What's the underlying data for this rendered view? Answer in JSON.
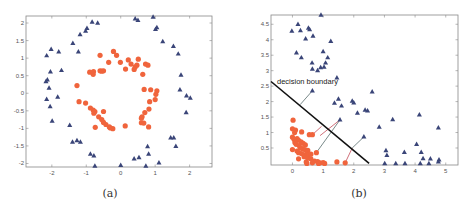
{
  "colors": {
    "class_circle": "#f0643c",
    "class_triangle": "#3a4578",
    "boundary": "#111111",
    "projection_gray": "#7a8a8a",
    "projection_red": "#d0707a",
    "axis": "#888888"
  },
  "chart_data": [
    {
      "type": "scatter",
      "caption": "(a)",
      "title": "",
      "xlabel": "",
      "ylabel": "",
      "xlim": [
        -2.75,
        2.65
      ],
      "ylim": [
        -2.1,
        2.2
      ],
      "xticks": [
        -2,
        -1,
        0,
        1,
        2
      ],
      "yticks": [
        -2,
        -1.5,
        -1,
        -0.5,
        0,
        0.5,
        1,
        1.5,
        2
      ],
      "xtick_labels": [
        "-2",
        "-1",
        "0",
        "1",
        "2"
      ],
      "ytick_labels": [
        "-2",
        "-1.5",
        "-1",
        "-0.5",
        "0",
        "0.5",
        "1",
        "1.5",
        "2"
      ],
      "grid": false,
      "series": [
        {
          "name": "outer ring",
          "marker": "triangle",
          "points": [
            [
              -0.83,
              2.03
            ],
            [
              -0.67,
              2.0
            ],
            [
              -0.98,
              1.85
            ],
            [
              -1.02,
              1.77
            ],
            [
              -1.18,
              1.67
            ],
            [
              -1.39,
              1.42
            ],
            [
              -1.23,
              1.18
            ],
            [
              -2.02,
              1.25
            ],
            [
              -1.8,
              1.18
            ],
            [
              -2.15,
              1.07
            ],
            [
              -1.72,
              0.65
            ],
            [
              -2.04,
              0.61
            ],
            [
              -2.13,
              0.38
            ],
            [
              -2.17,
              0.33
            ],
            [
              -2.08,
              0.15
            ],
            [
              -2.15,
              -0.17
            ],
            [
              -1.83,
              -0.11
            ],
            [
              -2.05,
              -0.38
            ],
            [
              -1.99,
              -0.79
            ],
            [
              -1.48,
              -0.91
            ],
            [
              -1.4,
              -1.39
            ],
            [
              -1.27,
              -1.35
            ],
            [
              -1.17,
              -1.39
            ],
            [
              -0.88,
              -1.73
            ],
            [
              -0.78,
              -1.78
            ],
            [
              -0.75,
              -2.07
            ],
            [
              0.0,
              -2.05
            ],
            [
              0.39,
              -1.87
            ],
            [
              0.53,
              -1.83
            ],
            [
              0.73,
              -2.07
            ],
            [
              0.78,
              -1.52
            ],
            [
              0.81,
              -1.73
            ],
            [
              1.11,
              -1.98
            ],
            [
              1.45,
              -1.27
            ],
            [
              1.54,
              -1.27
            ],
            [
              1.6,
              -1.51
            ],
            [
              1.9,
              -0.55
            ],
            [
              1.91,
              -0.07
            ],
            [
              2.02,
              -0.14
            ],
            [
              1.72,
              0.1
            ],
            [
              1.75,
              0.52
            ],
            [
              1.67,
              1.12
            ],
            [
              1.53,
              1.34
            ],
            [
              1.22,
              1.47
            ],
            [
              1.05,
              1.87
            ],
            [
              1.01,
              1.82
            ],
            [
              0.94,
              2.17
            ],
            [
              0.5,
              2.08
            ],
            [
              0.42,
              2.12
            ]
          ]
        },
        {
          "name": "inner ring",
          "marker": "circle",
          "points": [
            [
              -0.21,
              1.19
            ],
            [
              -0.12,
              1.08
            ],
            [
              -0.6,
              1.08
            ],
            [
              -0.35,
              0.88
            ],
            [
              -0.01,
              0.88
            ],
            [
              0.22,
              0.95
            ],
            [
              0.3,
              0.83
            ],
            [
              0.51,
              0.97
            ],
            [
              0.72,
              0.83
            ],
            [
              0.79,
              0.8
            ],
            [
              0.47,
              0.8
            ],
            [
              0.42,
              0.75
            ],
            [
              0.14,
              0.69
            ],
            [
              0.39,
              0.68
            ],
            [
              0.64,
              0.54
            ],
            [
              -0.55,
              0.63
            ],
            [
              -0.6,
              0.64
            ],
            [
              -0.5,
              0.64
            ],
            [
              -0.79,
              0.62
            ],
            [
              -0.9,
              0.6
            ],
            [
              -0.8,
              0.54
            ],
            [
              -1.27,
              0.22
            ],
            [
              0.68,
              0.11
            ],
            [
              0.87,
              0.1
            ],
            [
              1.05,
              0.07
            ],
            [
              1.02,
              -0.03
            ],
            [
              1.0,
              -0.18
            ],
            [
              0.84,
              -0.24
            ],
            [
              0.82,
              -0.45
            ],
            [
              0.7,
              -0.55
            ],
            [
              0.62,
              -0.67
            ],
            [
              0.6,
              -0.71
            ],
            [
              0.6,
              -0.84
            ],
            [
              0.67,
              -0.85
            ],
            [
              0.81,
              -0.96
            ],
            [
              0.13,
              -0.93
            ],
            [
              -0.23,
              -1.01
            ],
            [
              -0.3,
              -0.99
            ],
            [
              -0.33,
              -0.96
            ],
            [
              -0.43,
              -0.89
            ],
            [
              -0.5,
              -0.83
            ],
            [
              -0.55,
              -0.75
            ],
            [
              -0.74,
              -0.97
            ],
            [
              -0.5,
              -0.52
            ],
            [
              -0.75,
              -0.52
            ],
            [
              -0.8,
              -0.48
            ],
            [
              -0.78,
              -0.57
            ],
            [
              -0.88,
              -0.42
            ],
            [
              -0.64,
              -0.67
            ],
            [
              -1.21,
              -0.24
            ],
            [
              -1.02,
              -0.28
            ]
          ]
        }
      ]
    },
    {
      "type": "scatter",
      "caption": "(b)",
      "title": "",
      "xlabel": "",
      "ylabel": "",
      "xlim": [
        -0.7,
        5.4
      ],
      "ylim": [
        -0.05,
        4.8
      ],
      "xticks": [
        0,
        1,
        2,
        3,
        4,
        5
      ],
      "yticks": [
        0.5,
        1,
        1.5,
        2,
        2.5,
        3,
        3.5,
        4,
        4.5
      ],
      "xtick_labels": [
        "0",
        "1",
        "2",
        "3",
        "4",
        "5"
      ],
      "ytick_labels": [
        "0.5",
        "1",
        "1.5",
        "2",
        "2.5",
        "3",
        "3.5",
        "4",
        "4.5"
      ],
      "grid": false,
      "annotation": "decision boundary",
      "decision_boundary": {
        "from": [
          -0.7,
          2.65
        ],
        "to": [
          2.5,
          0.0
        ]
      },
      "series": [
        {
          "name": "class triangle",
          "marker": "triangle",
          "points": [
            [
              0.93,
              4.8
            ],
            [
              0.18,
              4.5
            ],
            [
              -0.02,
              4.28
            ],
            [
              0.26,
              4.3
            ],
            [
              0.52,
              4.38
            ],
            [
              0.56,
              4.33
            ],
            [
              0.67,
              4.12
            ],
            [
              0.43,
              4.03
            ],
            [
              1.25,
              3.95
            ],
            [
              0.13,
              3.58
            ],
            [
              0.29,
              3.42
            ],
            [
              1.0,
              3.62
            ],
            [
              1.15,
              3.42
            ],
            [
              0.64,
              3.25
            ],
            [
              1.08,
              3.25
            ],
            [
              0.65,
              3.05
            ],
            [
              0.82,
              3.0
            ],
            [
              0.92,
              3.1
            ],
            [
              1.03,
              3.12
            ],
            [
              1.45,
              2.77
            ],
            [
              0.65,
              2.35
            ],
            [
              2.6,
              2.32
            ],
            [
              1.5,
              2.08
            ],
            [
              1.37,
              1.95
            ],
            [
              1.6,
              1.86
            ],
            [
              1.95,
              2.02
            ],
            [
              2.0,
              1.96
            ],
            [
              2.12,
              1.63
            ],
            [
              2.37,
              1.73
            ],
            [
              2.45,
              1.7
            ],
            [
              1.55,
              1.41
            ],
            [
              3.27,
              1.42
            ],
            [
              2.83,
              1.18
            ],
            [
              4.14,
              1.57
            ],
            [
              4.76,
              1.15
            ],
            [
              2.33,
              0.86
            ],
            [
              4.05,
              0.62
            ],
            [
              3.05,
              0.42
            ],
            [
              3.08,
              0.26
            ],
            [
              3.65,
              0.36
            ],
            [
              4.2,
              0.36
            ],
            [
              4.26,
              0.16
            ],
            [
              4.5,
              0.15
            ],
            [
              4.78,
              0.12
            ],
            [
              4.76,
              0.05
            ],
            [
              3.01,
              0.0
            ],
            [
              3.37,
              0.0
            ],
            [
              3.67,
              0.0
            ],
            [
              4.17,
              0.0
            ],
            [
              4.45,
              0.0
            ]
          ]
        },
        {
          "name": "class circle",
          "marker": "circle",
          "points": [
            [
              0.02,
              1.4
            ],
            [
              0.0,
              1.12
            ],
            [
              0.1,
              1.08
            ],
            [
              0.07,
              1.0
            ],
            [
              0.3,
              1.02
            ],
            [
              0.0,
              0.85
            ],
            [
              0.05,
              0.78
            ],
            [
              0.15,
              0.8
            ],
            [
              0.2,
              0.75
            ],
            [
              0.28,
              0.7
            ],
            [
              0.08,
              0.68
            ],
            [
              0.12,
              0.62
            ],
            [
              0.22,
              0.58
            ],
            [
              0.35,
              0.65
            ],
            [
              0.42,
              0.6
            ],
            [
              0.25,
              0.5
            ],
            [
              0.32,
              0.48
            ],
            [
              0.4,
              0.45
            ],
            [
              0.5,
              0.42
            ],
            [
              0.0,
              0.45
            ],
            [
              0.15,
              0.4
            ],
            [
              0.2,
              0.35
            ],
            [
              0.3,
              0.32
            ],
            [
              0.45,
              0.3
            ],
            [
              0.52,
              0.28
            ],
            [
              0.6,
              0.3
            ],
            [
              0.38,
              0.22
            ],
            [
              0.5,
              0.18
            ],
            [
              0.6,
              0.15
            ],
            [
              0.2,
              0.15
            ],
            [
              0.55,
              0.93
            ],
            [
              0.65,
              0.93
            ],
            [
              0.72,
              0.08
            ],
            [
              0.82,
              0.06
            ],
            [
              0.45,
              0.05
            ],
            [
              0.65,
              0.02
            ],
            [
              0.9,
              0.02
            ],
            [
              1.0,
              0.03
            ],
            [
              1.05,
              0.0
            ],
            [
              0.47,
              0.0
            ],
            [
              1.45,
              0.05
            ],
            [
              1.72,
              0.02
            ],
            [
              0.78,
              0.35
            ],
            [
              0.85,
              0.0
            ]
          ]
        }
      ],
      "projections": [
        {
          "from": [
            0.65,
            2.35
          ],
          "to": [
            0.25,
            1.9
          ],
          "color": "gray"
        },
        {
          "from": [
            1.55,
            1.41
          ],
          "to": [
            0.9,
            0.9
          ],
          "color": "red"
        },
        {
          "from": [
            1.55,
            1.41
          ],
          "to": [
            0.78,
            0.35
          ],
          "color": "gray"
        },
        {
          "from": [
            2.33,
            0.86
          ],
          "to": [
            1.95,
            0.5
          ],
          "color": "gray"
        },
        {
          "from": [
            1.95,
            0.5
          ],
          "to": [
            1.72,
            0.02
          ],
          "color": "red"
        },
        {
          "from": [
            0.95,
            1.2
          ],
          "to": [
            0.65,
            0.93
          ],
          "color": "red"
        }
      ]
    }
  ]
}
